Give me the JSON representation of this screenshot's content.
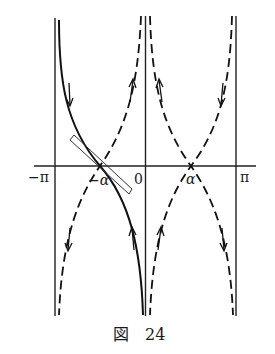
{
  "figure": {
    "caption": "図　24",
    "labels": {
      "neg_pi": "−π",
      "zero": "0",
      "pi": "π",
      "neg_alpha": "−α",
      "alpha": "α"
    }
  }
}
